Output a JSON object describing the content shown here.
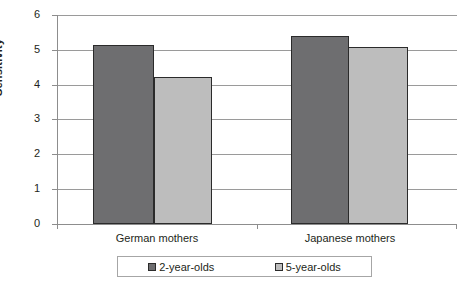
{
  "chart_data": {
    "type": "bar",
    "title": "",
    "xlabel": "",
    "ylabel": "Sensitivity",
    "categories": [
      "German mothers",
      "Japanese mothers"
    ],
    "series": [
      {
        "name": "2-year-olds",
        "values": [
          5.15,
          5.4
        ],
        "color": "#6e6e70"
      },
      {
        "name": "5-year-olds",
        "values": [
          4.22,
          5.08
        ],
        "color": "#bdbdbd"
      }
    ],
    "ylim": [
      0,
      6
    ],
    "yticks": [
      0,
      1,
      2,
      3,
      4,
      5,
      6
    ],
    "ytick_labels": [
      "0",
      "1",
      "2",
      "3",
      "4",
      "5",
      "6"
    ],
    "grid": true,
    "legend_position": "bottom"
  },
  "axis": {
    "y_title": "Sensitivity",
    "ticks": [
      {
        "label": "6",
        "value": 6
      },
      {
        "label": "5",
        "value": 5
      },
      {
        "label": "4",
        "value": 4
      },
      {
        "label": "3",
        "value": 3
      },
      {
        "label": "2",
        "value": 2
      },
      {
        "label": "1",
        "value": 1
      },
      {
        "label": "0",
        "value": 0
      }
    ]
  },
  "categories": [
    {
      "label": "German mothers"
    },
    {
      "label": "Japanese mothers"
    }
  ],
  "legend": {
    "entries": [
      {
        "label": "2-year-olds",
        "color": "#6e6e70"
      },
      {
        "label": "5-year-olds",
        "color": "#bdbdbd"
      }
    ]
  },
  "bars": [
    {
      "name": "german-2-year-olds",
      "value": 5.15,
      "series": "2-year-olds",
      "category": "German mothers"
    },
    {
      "name": "german-5-year-olds",
      "value": 4.22,
      "series": "5-year-olds",
      "category": "German mothers"
    },
    {
      "name": "japanese-2-year-olds",
      "value": 5.4,
      "series": "2-year-olds",
      "category": "Japanese mothers"
    },
    {
      "name": "japanese-5-year-olds",
      "value": 5.08,
      "series": "5-year-olds",
      "category": "Japanese mothers"
    }
  ]
}
